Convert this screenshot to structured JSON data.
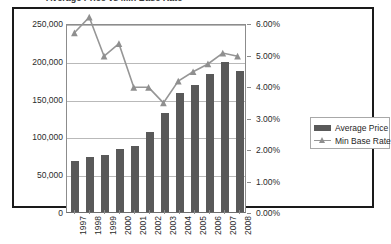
{
  "title": "Average Price vs Min Base Rate",
  "legend": {
    "position": "right",
    "entries": [
      {
        "label": "Average Price",
        "marker": "bar-swatch",
        "color": "#595959"
      },
      {
        "label": "Min Base Rate",
        "marker": "line-triangle",
        "color": "#969696"
      }
    ]
  },
  "axes": {
    "left": {
      "ticks": [
        "0",
        "50,000",
        "100,000",
        "150,000",
        "200,000",
        "250,000"
      ],
      "min": 0,
      "max": 250000,
      "step": 50000
    },
    "right": {
      "ticks": [
        "0.00%",
        "1.00%",
        "2.00%",
        "3.00%",
        "4.00%",
        "5.00%",
        "6.00%"
      ],
      "min": 0,
      "max": 6,
      "step": 1
    },
    "bottom": {
      "labels": [
        "1997",
        "1998",
        "1999",
        "2000",
        "2001",
        "2002",
        "2003",
        "2004",
        "2005",
        "2006",
        "2007",
        "2008"
      ],
      "rotation": -90
    }
  },
  "chart_data": {
    "type": "bar",
    "title": "Average Price vs Min Base Rate",
    "xlabel": "",
    "ylabel": "",
    "grid": true,
    "legend_position": "right",
    "categories": [
      "1997",
      "1998",
      "1999",
      "2000",
      "2001",
      "2002",
      "2003",
      "2004",
      "2005",
      "2006",
      "2007",
      "2008"
    ],
    "series": [
      {
        "name": "Average Price",
        "type": "bar",
        "axis": "left",
        "color": "#595959",
        "values": [
          68000,
          73000,
          76000,
          84000,
          87000,
          106000,
          131000,
          157000,
          168000,
          182000,
          199000,
          186000
        ],
        "ylim": [
          0,
          250000
        ],
        "ytick_labels": [
          "0",
          "50,000",
          "100,000",
          "150,000",
          "200,000",
          "250,000"
        ]
      },
      {
        "name": "Min Base Rate",
        "type": "line",
        "axis": "right",
        "color": "#969696",
        "marker": "triangle",
        "values": [
          5.75,
          6.25,
          5.0,
          5.4,
          4.0,
          4.0,
          3.5,
          4.2,
          4.5,
          4.75,
          5.1,
          5.0
        ],
        "ylim": [
          0,
          6
        ],
        "ytick_labels": [
          "0.00%",
          "1.00%",
          "2.00%",
          "3.00%",
          "4.00%",
          "5.00%",
          "6.00%"
        ]
      }
    ]
  }
}
